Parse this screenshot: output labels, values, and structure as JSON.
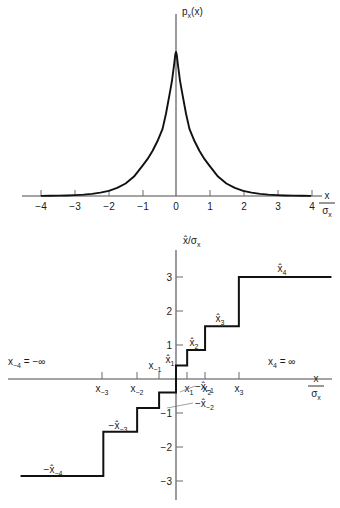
{
  "figure": {
    "background": "#ffffff",
    "ink": "#111111",
    "axis_color": "#4a4a4a"
  },
  "chart_data": [
    {
      "id": "pdf",
      "type": "line",
      "title": "p",
      "title_sub": "x",
      "title_tail": "(x)",
      "xlabel_num": "x",
      "xlabel_den": "σ",
      "xlabel_den_sub": "x",
      "ylabel": "pₓ(x)",
      "xlim": [
        -4.6,
        4.6
      ],
      "ylim": [
        0,
        1.05
      ],
      "grid": false,
      "legend": "none",
      "description": "Laplacian (two-sided exponential) probability density of x versus x/sigma_x, sharply peaked at zero.",
      "xticks": [
        -4,
        -3,
        -2,
        -1,
        0,
        1,
        2,
        3,
        4
      ],
      "xticklabels": [
        "−4",
        "−3",
        "−2",
        "−1",
        "0",
        "1",
        "2",
        "3",
        "4"
      ],
      "x": [
        -4.0,
        -3.75,
        -3.5,
        -3.25,
        -3.0,
        -2.75,
        -2.5,
        -2.25,
        -2.0,
        -1.75,
        -1.5,
        -1.25,
        -1.0,
        -0.85,
        -0.7,
        -0.55,
        -0.4,
        -0.3,
        -0.2,
        -0.12,
        -0.06,
        -0.02,
        0.0,
        0.02,
        0.06,
        0.12,
        0.2,
        0.3,
        0.4,
        0.55,
        0.7,
        0.85,
        1.0,
        1.25,
        1.5,
        1.75,
        2.0,
        2.25,
        2.5,
        2.75,
        3.0,
        3.25,
        3.5,
        3.75,
        4.0
      ],
      "y": [
        0.0034,
        0.0053,
        0.0082,
        0.0127,
        0.0198,
        0.0307,
        0.0477,
        0.0742,
        0.1153,
        0.1791,
        0.278,
        0.4317,
        0.6703,
        0.8187,
        1.0,
        1.2214,
        1.4918,
        1.8221,
        2.2255,
        2.56,
        2.9,
        3.15,
        3.2,
        3.15,
        2.9,
        2.56,
        2.2255,
        1.8221,
        1.4918,
        1.2214,
        1.0,
        0.8187,
        0.6703,
        0.4317,
        0.278,
        0.1791,
        0.1153,
        0.0742,
        0.0477,
        0.0307,
        0.0198,
        0.0127,
        0.0082,
        0.0053,
        0.0034
      ],
      "y_normalized_note": "values normalized to peak = 1 when plotted"
    },
    {
      "id": "quantizer",
      "type": "line",
      "subtype": "staircase",
      "description": "Nonuniform quantizer characteristic: output level x-hat / sigma_x versus input x / sigma_x, an odd-symmetric staircase with 8 levels.",
      "ylabel_num": "x̂",
      "ylabel_den": "σ",
      "ylabel_den_sub": "x",
      "xlabel_num": "x",
      "xlabel_den": "σ",
      "xlabel_den_sub": "x",
      "xlim": [
        -4.6,
        4.6
      ],
      "ylim": [
        -3.35,
        3.35
      ],
      "grid": false,
      "legend": "none",
      "yticks": [
        3,
        2,
        1,
        -1,
        -2,
        -3
      ],
      "yticklabels": [
        "3",
        "2",
        "1",
        "−1",
        "−2",
        "−3"
      ],
      "decision_levels": {
        "x_m3": -2.15,
        "x_m2": -1.15,
        "x_m1": -0.5,
        "x_0": 0.0,
        "x_1": 0.33,
        "x_2": 0.86,
        "x_3": 1.86
      },
      "reconstruction_levels": {
        "xhat_1": 0.4,
        "xhat_2": 0.85,
        "xhat_3": 1.55,
        "xhat_4": 3.0,
        "xhat_m1": -0.4,
        "xhat_m2": -0.85,
        "xhat_m3": -1.55,
        "xhat_m4": -2.85
      },
      "steps": [
        {
          "x_from": -4.6,
          "x_to": -2.15,
          "y": -2.85,
          "label": "−x̂₋₄"
        },
        {
          "x_from": -2.15,
          "x_to": -1.15,
          "y": -1.55,
          "label": "−x̂₋₃"
        },
        {
          "x_from": -1.15,
          "x_to": -0.5,
          "y": -0.85,
          "label": "−x̂₋₂"
        },
        {
          "x_from": -0.5,
          "x_to": 0.0,
          "y": -0.4,
          "label": "−x̂₋₁"
        },
        {
          "x_from": 0.0,
          "x_to": 0.33,
          "y": 0.4,
          "label": "x̂₁"
        },
        {
          "x_from": 0.33,
          "x_to": 0.86,
          "y": 0.85,
          "label": "x̂₂"
        },
        {
          "x_from": 0.86,
          "x_to": 1.86,
          "y": 1.55,
          "label": "x̂₃"
        },
        {
          "x_from": 1.86,
          "x_to": 4.6,
          "y": 3.0,
          "label": "x̂₄"
        }
      ]
    }
  ],
  "labels": {
    "pdf_title": {
      "base": "p",
      "sub": "x",
      "tail": "(x)"
    },
    "axis_x_over_sigma": {
      "num": "x",
      "den_base": "σ",
      "den_sub": "x"
    },
    "axis_xhat_over_sigma": {
      "num": "x̂",
      "den_base": "σ",
      "den_sub": "x"
    },
    "left_infinity": {
      "base": "x",
      "sub": "−4",
      "eq": " = −∞"
    },
    "right_infinity": {
      "base": "x",
      "sub": "4",
      "eq": " = ∞"
    },
    "threshold_marks": [
      {
        "base": "x",
        "sub": "−3",
        "x": -2.15,
        "side": "below"
      },
      {
        "base": "x",
        "sub": "−2",
        "x": -1.15,
        "side": "below"
      },
      {
        "base": "x",
        "sub": "−1",
        "x": -0.5,
        "side": "above"
      },
      {
        "base": "x",
        "sub": "1",
        "x": 0.33,
        "side": "below"
      },
      {
        "base": "x",
        "sub": "2",
        "x": 0.86,
        "side": "below"
      },
      {
        "base": "x",
        "sub": "3",
        "x": 1.86,
        "side": "below"
      }
    ],
    "level_labels_pos": [
      {
        "base": "x̂",
        "sub": "1",
        "lead": ""
      },
      {
        "base": "x̂",
        "sub": "2",
        "lead": ""
      },
      {
        "base": "x̂",
        "sub": "3",
        "lead": ""
      },
      {
        "base": "x̂",
        "sub": "4",
        "lead": ""
      }
    ],
    "level_labels_neg": [
      {
        "base": "x̂",
        "sub": "−1",
        "lead": "−"
      },
      {
        "base": "x̂",
        "sub": "−2",
        "lead": "−"
      },
      {
        "base": "x̂",
        "sub": "−3",
        "lead": "−"
      },
      {
        "base": "x̂",
        "sub": "−4",
        "lead": "−"
      }
    ],
    "pdf_xticks": [
      "−4",
      "−3",
      "−2",
      "−1",
      "0",
      "1",
      "2",
      "3",
      "4"
    ],
    "quant_yticks_pos": [
      "3",
      "2",
      "1"
    ],
    "quant_yticks_neg": [
      "−1",
      "−2",
      "−3"
    ]
  }
}
